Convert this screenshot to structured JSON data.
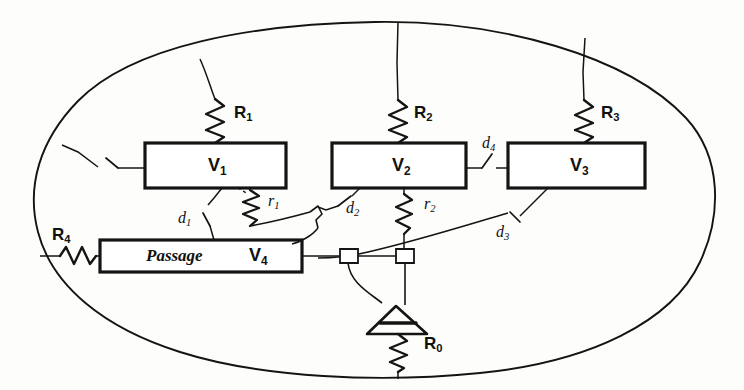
{
  "figure": {
    "kind": "hand-drawn electrical network schematic",
    "enclosure": {
      "shape": "ellipse",
      "label": ""
    }
  },
  "boxes": [
    {
      "id": "v1",
      "label": "V",
      "sub": "1",
      "x": 145,
      "y": 143,
      "w": 141,
      "h": 45
    },
    {
      "id": "v2",
      "label": "V",
      "sub": "2",
      "x": 332,
      "y": 143,
      "w": 134,
      "h": 45
    },
    {
      "id": "v3",
      "label": "V",
      "sub": "3",
      "x": 508,
      "y": 143,
      "w": 137,
      "h": 45
    },
    {
      "id": "v4",
      "prefix": "Passage",
      "label": "V",
      "sub": "4",
      "x": 100,
      "y": 240,
      "w": 202,
      "h": 32
    }
  ],
  "resistors": [
    {
      "id": "r0",
      "label": "R",
      "sub": "0",
      "orientation": "vertical",
      "note": "below ground/antenna triangle, to ellipse bottom"
    },
    {
      "id": "r1",
      "label": "R",
      "sub": "1",
      "orientation": "vertical",
      "note": "above V1, to ellipse top"
    },
    {
      "id": "r2",
      "label": "R",
      "sub": "2",
      "orientation": "vertical",
      "note": "above V2, to ellipse top"
    },
    {
      "id": "r3",
      "label": "R",
      "sub": "3",
      "orientation": "vertical",
      "note": "above V3, to ellipse top"
    },
    {
      "id": "r4",
      "label": "R",
      "sub": "4",
      "orientation": "horizontal",
      "note": "left of Passage V4, to ellipse left"
    },
    {
      "id": "rr1",
      "label": "r",
      "sub": "1",
      "orientation": "vertical",
      "note": "below V1, to bus"
    },
    {
      "id": "rr2",
      "label": "r",
      "sub": "2",
      "orientation": "vertical",
      "note": "below V2, to bus"
    }
  ],
  "switches": [
    {
      "id": "d1",
      "label": "d",
      "sub": "1",
      "note": "between V1 bottom and Passage V4 top"
    },
    {
      "id": "d2",
      "label": "d",
      "sub": "2",
      "note": "between V2 bottom and bus junction"
    },
    {
      "id": "d3",
      "label": "d",
      "sub": "3",
      "note": "between V3 bottom and bus"
    },
    {
      "id": "d4",
      "label": "d",
      "sub": "4",
      "note": "between V2 right and V3 left"
    },
    {
      "id": "d0",
      "label": "",
      "sub": "",
      "note": "unlabeled switch between ellipse left and V1 left"
    }
  ],
  "symbols": [
    {
      "id": "ground-triangle",
      "name": "ground-antenna-triangle"
    },
    {
      "id": "node-a",
      "name": "bus-junction-node"
    },
    {
      "id": "node-b",
      "name": "bus-junction-node"
    }
  ],
  "labels": {
    "R0": {
      "base": "R",
      "sub": "0",
      "x": 425,
      "y": 337
    },
    "R1": {
      "base": "R",
      "sub": "1",
      "x": 234,
      "y": 107
    },
    "R2": {
      "base": "R",
      "sub": "2",
      "x": 412,
      "y": 107
    },
    "R3": {
      "base": "R",
      "sub": "3",
      "x": 600,
      "y": 107
    },
    "R4": {
      "base": "R",
      "sub": "4",
      "x": 53,
      "y": 227
    },
    "r1": {
      "base": "r",
      "sub": "1",
      "x": 269,
      "y": 196
    },
    "r2": {
      "base": "r",
      "sub": "2",
      "x": 425,
      "y": 199
    },
    "d1": {
      "base": "d",
      "sub": "1",
      "x": 180,
      "y": 212
    },
    "d2": {
      "base": "d",
      "sub": "2",
      "x": 347,
      "y": 202
    },
    "d3": {
      "base": "d",
      "sub": "3",
      "x": 497,
      "y": 226
    },
    "d4": {
      "base": "d",
      "sub": "4",
      "x": 483,
      "y": 138
    },
    "V1": {
      "base": "V",
      "sub": "1",
      "x": 208,
      "y": 156
    },
    "V2": {
      "base": "V",
      "sub": "2",
      "x": 392,
      "y": 156
    },
    "V3": {
      "base": "V",
      "sub": "3",
      "x": 570,
      "y": 156
    },
    "V4": {
      "base": "V",
      "sub": "4",
      "x": 249,
      "y": 248
    },
    "Passage": {
      "base": "Passage",
      "sub": "",
      "x": 146,
      "y": 248
    }
  },
  "style": {
    "ink": "#141414",
    "paper": "#fdfdfb",
    "box_stroke_width": 3.2,
    "wire_stroke_width": 1.5,
    "ellipse_stroke_width": 1.8
  }
}
